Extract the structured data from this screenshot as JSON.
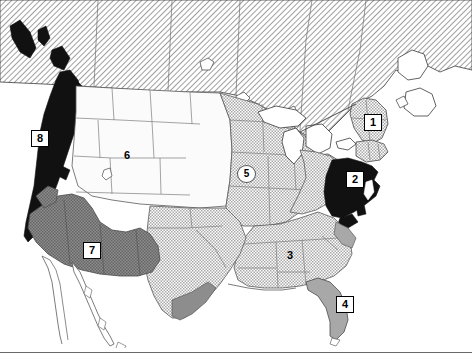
{
  "figure": {
    "background_color": "#ffffff",
    "width": 472,
    "height": 364
  },
  "footer_rule": {
    "y": 352,
    "color": "#6a6a6a"
  },
  "legend_colors": {
    "solid_black": "#111111",
    "dark_gray": "#7b7b7b",
    "medium_gray": "#a8a8a8",
    "light_hatch": "#c8c8c8",
    "unshaded_white": "#fbfbfb",
    "canada_hatch": "#c0c0c0",
    "water_white": "#ffffff",
    "outline": "#3a3a3a"
  },
  "markers": [
    {
      "id": "marker-1",
      "label": "1",
      "style": "box",
      "x": 372,
      "y": 121,
      "region": "northern-new-england",
      "fill": "light_hatch"
    },
    {
      "id": "marker-2",
      "label": "2",
      "style": "box",
      "x": 354,
      "y": 178,
      "region": "mid-atlantic",
      "fill": "solid_black"
    },
    {
      "id": "marker-3",
      "label": "3",
      "style": "plain",
      "x": 290,
      "y": 255,
      "region": "deep-south",
      "fill": "light_hatch"
    },
    {
      "id": "marker-4",
      "label": "4",
      "style": "box",
      "x": 344,
      "y": 303,
      "region": "florida",
      "fill": "medium_gray"
    },
    {
      "id": "marker-5",
      "label": "5",
      "style": "oval",
      "x": 245,
      "y": 173,
      "region": "midwest-plains",
      "fill": "light_hatch"
    },
    {
      "id": "marker-6",
      "label": "6",
      "style": "plain",
      "x": 127,
      "y": 155,
      "region": "interior-west",
      "fill": "unshaded_white"
    },
    {
      "id": "marker-7",
      "label": "7",
      "style": "box",
      "x": 91,
      "y": 249,
      "region": "southwest-border",
      "fill": "dark_gray"
    },
    {
      "id": "marker-8",
      "label": "8",
      "style": "box",
      "x": 39,
      "y": 137,
      "region": "pacific-coast",
      "fill": "solid_black"
    }
  ]
}
